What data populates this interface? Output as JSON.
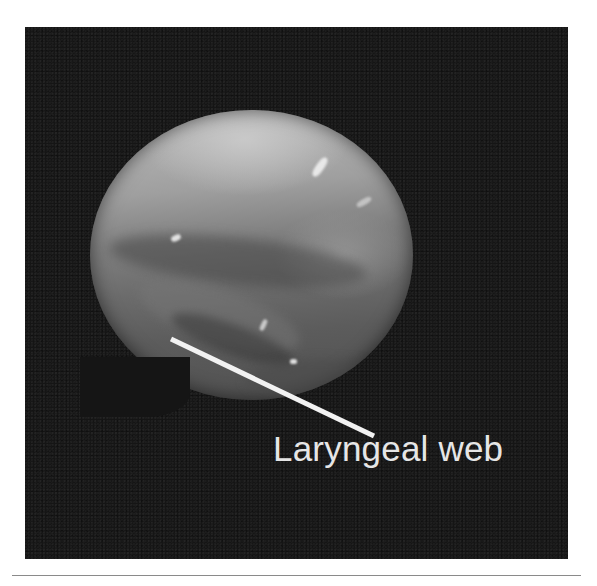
{
  "figure": {
    "annotation": {
      "label": "Laryngeal web",
      "line_color": "#f2f2f2",
      "line_start": [
        171,
        339
      ],
      "line_end": [
        374,
        436
      ]
    },
    "colors": {
      "background": "#151515",
      "page": "#ffffff",
      "label_text": "#e6e6e6",
      "rule": "#8a8a8a"
    }
  }
}
